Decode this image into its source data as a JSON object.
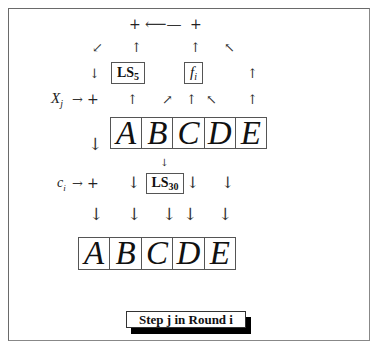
{
  "diagram": {
    "caption": "Step j in Round i",
    "top_plus_left": "+",
    "top_plus_right": "+",
    "top_long_arrow": "⟵",
    "xj_label": "X",
    "xj_sub": "j",
    "ci_label": "c",
    "ci_sub": "i",
    "right_arrow": "→",
    "plus": "+",
    "ls5": {
      "text": "LS",
      "sub": "5"
    },
    "ls30": {
      "text": "LS",
      "sub": "30"
    },
    "fi": {
      "text": "f",
      "sub": "i"
    },
    "register_in": [
      "A",
      "B",
      "C",
      "D",
      "E"
    ],
    "register_out": [
      "A",
      "B",
      "C",
      "D",
      "E"
    ],
    "arrows": {
      "down": "↓",
      "up": "↑",
      "sw": "↙",
      "nw": "↖",
      "ne": "↗"
    }
  }
}
